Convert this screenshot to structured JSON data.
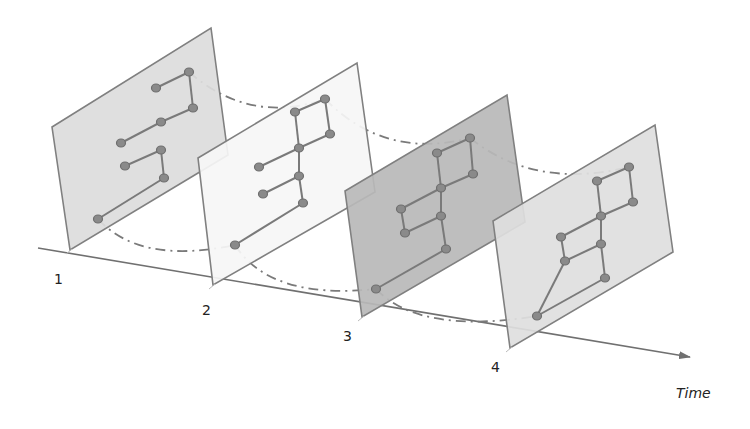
{
  "diagram": {
    "type": "temporal-graph-snapshots",
    "axis": {
      "label": "Time",
      "start": [
        38,
        248
      ],
      "end": [
        690,
        357
      ],
      "color": "#707070"
    },
    "colors": {
      "panel_stroke": "#808080",
      "node_fill": "#8a8a8a",
      "node_stroke": "#6e6e6e",
      "edge": "#7a7a7a",
      "arc": "#7a7a7a"
    },
    "snapshots": [
      {
        "label": "1",
        "label_pos": [
          54,
          284
        ],
        "fill": "#dcdcdc",
        "corners": [
          [
            52,
            127
          ],
          [
            211,
            28
          ],
          [
            228,
            155
          ],
          [
            70,
            250
          ]
        ],
        "nodes": [
          [
            156,
            88
          ],
          [
            189,
            72
          ],
          [
            193,
            108
          ],
          [
            161,
            122
          ],
          [
            121,
            143
          ],
          [
            161,
            150
          ],
          [
            125,
            166
          ],
          [
            164,
            178
          ],
          [
            98,
            219
          ]
        ],
        "edges": [
          [
            0,
            1
          ],
          [
            1,
            2
          ],
          [
            2,
            3
          ],
          [
            3,
            4
          ],
          [
            5,
            6
          ],
          [
            5,
            7
          ],
          [
            7,
            8
          ]
        ]
      },
      {
        "label": "2",
        "label_pos": [
          202,
          315
        ],
        "fill": "#f6f6f6",
        "corners": [
          [
            198,
            158
          ],
          [
            357,
            63
          ],
          [
            375,
            192
          ],
          [
            213,
            285
          ]
        ],
        "nodes": [
          [
            295,
            112
          ],
          [
            325,
            99
          ],
          [
            330,
            134
          ],
          [
            299,
            148
          ],
          [
            259,
            167
          ],
          [
            299,
            176
          ],
          [
            263,
            194
          ],
          [
            303,
            203
          ],
          [
            235,
            245
          ]
        ],
        "edges": [
          [
            0,
            1
          ],
          [
            1,
            2
          ],
          [
            2,
            3
          ],
          [
            3,
            4
          ],
          [
            0,
            3
          ],
          [
            3,
            5
          ],
          [
            5,
            6
          ],
          [
            5,
            7
          ],
          [
            7,
            8
          ]
        ]
      },
      {
        "label": "3",
        "label_pos": [
          343,
          341
        ],
        "fill": "#b9b9b9",
        "corners": [
          [
            345,
            191
          ],
          [
            507,
            95
          ],
          [
            525,
            222
          ],
          [
            362,
            317
          ]
        ],
        "nodes": [
          [
            437,
            153
          ],
          [
            470,
            138
          ],
          [
            473,
            174
          ],
          [
            441,
            188
          ],
          [
            401,
            209
          ],
          [
            441,
            216
          ],
          [
            405,
            233
          ],
          [
            446,
            249
          ],
          [
            376,
            289
          ]
        ],
        "edges": [
          [
            0,
            1
          ],
          [
            1,
            2
          ],
          [
            2,
            3
          ],
          [
            3,
            4
          ],
          [
            0,
            3
          ],
          [
            3,
            5
          ],
          [
            5,
            7
          ],
          [
            4,
            6
          ],
          [
            6,
            5
          ],
          [
            7,
            8
          ]
        ]
      },
      {
        "label": "4",
        "label_pos": [
          491,
          372
        ],
        "fill": "#dedede",
        "corners": [
          [
            493,
            221
          ],
          [
            655,
            125
          ],
          [
            673,
            252
          ],
          [
            510,
            348
          ]
        ],
        "nodes": [
          [
            597,
            181
          ],
          [
            629,
            167
          ],
          [
            633,
            202
          ],
          [
            601,
            216
          ],
          [
            561,
            237
          ],
          [
            601,
            244
          ],
          [
            565,
            261
          ],
          [
            605,
            278
          ],
          [
            537,
            316
          ]
        ],
        "edges": [
          [
            0,
            1
          ],
          [
            1,
            2
          ],
          [
            2,
            3
          ],
          [
            3,
            4
          ],
          [
            0,
            3
          ],
          [
            3,
            5
          ],
          [
            5,
            7
          ],
          [
            4,
            6
          ],
          [
            6,
            5
          ],
          [
            6,
            8
          ],
          [
            7,
            8
          ]
        ]
      }
    ],
    "arcs": [
      {
        "from": [
          189,
          72
        ],
        "ctrl": [
          250,
          125
        ],
        "to": [
          325,
          99
        ]
      },
      {
        "from": [
          325,
          99
        ],
        "ctrl": [
          385,
          160
        ],
        "to": [
          470,
          138
        ]
      },
      {
        "from": [
          470,
          138
        ],
        "ctrl": [
          535,
          190
        ],
        "to": [
          629,
          167
        ]
      },
      {
        "from": [
          98,
          219
        ],
        "ctrl": [
          140,
          265
        ],
        "to": [
          235,
          245
        ]
      },
      {
        "from": [
          235,
          245
        ],
        "ctrl": [
          270,
          300
        ],
        "to": [
          376,
          289
        ]
      },
      {
        "from": [
          376,
          289
        ],
        "ctrl": [
          420,
          335
        ],
        "to": [
          537,
          316
        ]
      }
    ],
    "time_label_pos": [
      676,
      398
    ]
  }
}
